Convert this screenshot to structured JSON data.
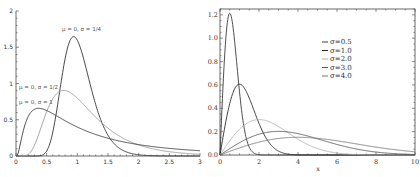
{
  "chart_data": [
    {
      "type": "line",
      "title": "Log-normal probability density functions",
      "xlabel": "",
      "ylabel": "",
      "xlim": [
        0,
        3
      ],
      "ylim": [
        0,
        2
      ],
      "grid": false,
      "x_ticks": [
        "0",
        "0.5",
        "1",
        "1.5",
        "2",
        "2.5",
        "3"
      ],
      "y_ticks": [
        "0",
        "0.5",
        "1",
        "1.5",
        "2"
      ],
      "annotations": [
        {
          "text": "μ = 0, σ = 1/4",
          "x": 0.75,
          "y": 1.72
        },
        {
          "text": "μ = 0, σ = 1/2",
          "x": 0.05,
          "y": 0.93
        },
        {
          "text": "μ = 0, σ = 1",
          "x": 0.05,
          "y": 0.72
        }
      ],
      "series": [
        {
          "name": "μ = 0, σ = 1/4",
          "mu": 0,
          "sigma": 0.25,
          "color": "#333333",
          "peak_x": 0.94,
          "peak_y": 1.66
        },
        {
          "name": "μ = 0, σ = 1/2",
          "mu": 0,
          "sigma": 0.5,
          "color": "#9a9a9a",
          "peak_x": 0.78,
          "peak_y": 0.91
        },
        {
          "name": "μ = 0, σ = 1",
          "mu": 0,
          "sigma": 1.0,
          "color": "#3a3a3a",
          "peak_x": 0.37,
          "peak_y": 0.66
        }
      ]
    },
    {
      "type": "line",
      "title": "Rayleigh probability density functions",
      "xlabel": "x",
      "ylabel": "",
      "xlim": [
        0,
        10
      ],
      "ylim": [
        0,
        1.25
      ],
      "grid": false,
      "legend_position": "upper-center-right",
      "x_ticks": [
        "0",
        "2",
        "4",
        "6",
        "8",
        "10"
      ],
      "y_ticks": [
        "0.0",
        "0.2",
        "0.4",
        "0.6",
        "0.8",
        "1.0",
        "1.2"
      ],
      "series": [
        {
          "name": "σ=0.5",
          "sigma": 0.5,
          "color": "#3a3a3a",
          "peak_x": 0.5,
          "peak_y": 1.21
        },
        {
          "name": "σ=1.0",
          "sigma": 1.0,
          "color": "#2a2a2a",
          "peak_x": 1.0,
          "peak_y": 0.61
        },
        {
          "name": "σ=2.0",
          "sigma": 2.0,
          "color": "#b0b0b0",
          "peak_x": 2.0,
          "peak_y": 0.3
        },
        {
          "name": "σ=3.0",
          "sigma": 3.0,
          "color": "#555555",
          "peak_x": 3.0,
          "peak_y": 0.2
        },
        {
          "name": "σ=4.0",
          "sigma": 4.0,
          "color": "#777777",
          "peak_x": 4.0,
          "peak_y": 0.15
        }
      ]
    }
  ]
}
